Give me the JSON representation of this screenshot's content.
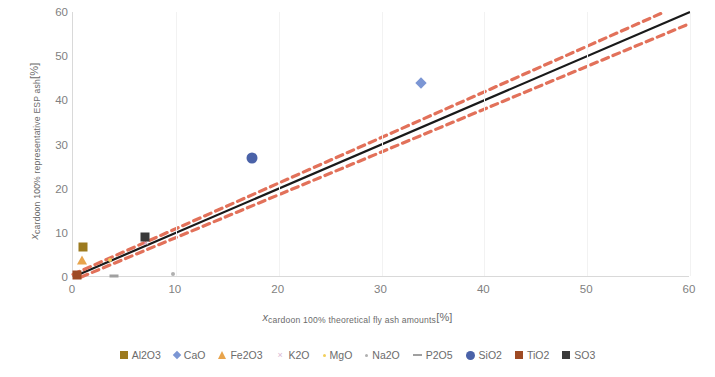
{
  "chart_data": {
    "type": "scatter",
    "title": "",
    "xlabel_parts": {
      "var": "x",
      "sub": "cardoon 100% theoretical fly ash amounts",
      "unit": "[%]"
    },
    "ylabel_parts": {
      "var": "x",
      "sub": "cardoon 100% representative ESP ash",
      "unit": "[%]"
    },
    "xlim": [
      0,
      60
    ],
    "ylim": [
      0,
      60
    ],
    "xticks": [
      0,
      10,
      20,
      30,
      40,
      50,
      60
    ],
    "yticks": [
      0,
      10,
      20,
      30,
      40,
      50,
      60
    ],
    "grid": "vertical-light",
    "legend_position": "bottom",
    "series": [
      {
        "name": "Al2O3",
        "marker": "square",
        "color": "#9c7a1e",
        "points": [
          {
            "x": 1.0,
            "y": 6.9
          }
        ]
      },
      {
        "name": "CaO",
        "marker": "diamond",
        "color": "#7b96d4",
        "points": [
          {
            "x": 33.8,
            "y": 44.0
          }
        ]
      },
      {
        "name": "Fe2O3",
        "marker": "triangle",
        "color": "#e8a44c",
        "points": [
          {
            "x": 0.9,
            "y": 3.9
          }
        ]
      },
      {
        "name": "K2O",
        "marker": "x",
        "color": "#d9b8d4",
        "points": [
          {
            "x": 7.1,
            "y": 7.6
          }
        ]
      },
      {
        "name": "MgO",
        "marker": "dot",
        "color": "#f2cf5b",
        "points": [
          {
            "x": 3.6,
            "y": 3.9
          }
        ]
      },
      {
        "name": "Na2O",
        "marker": "dot",
        "color": "#b0b0b0",
        "points": [
          {
            "x": 9.7,
            "y": 0.6
          }
        ]
      },
      {
        "name": "P2O5",
        "marker": "dash",
        "color": "#a0a0a0",
        "points": [
          {
            "x": 4.0,
            "y": 0.2
          }
        ]
      },
      {
        "name": "SiO2",
        "marker": "circle",
        "color": "#4a62a8",
        "points": [
          {
            "x": 17.4,
            "y": 27.0
          }
        ]
      },
      {
        "name": "TiO2",
        "marker": "square",
        "color": "#9e4a24",
        "points": [
          {
            "x": 0.4,
            "y": 0.4
          }
        ]
      },
      {
        "name": "SO3",
        "marker": "square",
        "color": "#3a3a3a",
        "points": [
          {
            "x": 7.0,
            "y": 9.0
          }
        ]
      }
    ],
    "fit_lines": [
      {
        "name": "regression-line",
        "style": "solid",
        "color": "#1a1a1a",
        "x": [
          0,
          60
        ],
        "y": [
          0,
          60
        ]
      },
      {
        "name": "upper-confidence-band",
        "style": "dashed",
        "color": "#e2715a",
        "x": [
          0,
          57.5
        ],
        "y": [
          0.6,
          60
        ]
      },
      {
        "name": "lower-confidence-band",
        "style": "dashed",
        "color": "#e2715a",
        "x": [
          0.8,
          60
        ],
        "y": [
          0,
          57.4
        ]
      }
    ]
  },
  "legend": {
    "items": [
      {
        "label": "Al2O3"
      },
      {
        "label": "CaO"
      },
      {
        "label": "Fe2O3"
      },
      {
        "label": "K2O"
      },
      {
        "label": "MgO"
      },
      {
        "label": "Na2O"
      },
      {
        "label": "P2O5"
      },
      {
        "label": "SiO2"
      },
      {
        "label": "TiO2"
      },
      {
        "label": "SO3"
      }
    ]
  }
}
